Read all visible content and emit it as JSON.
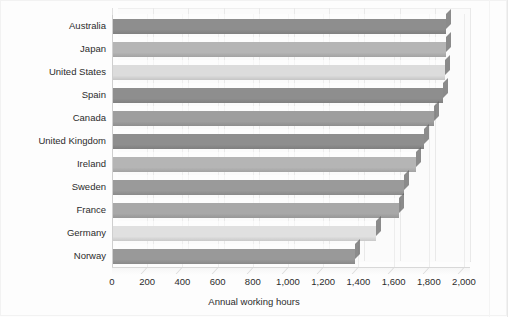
{
  "chart_data": {
    "type": "bar",
    "orientation": "horizontal",
    "title": "",
    "xlabel": "Annual working hours",
    "ylabel": "",
    "xlim": [
      0,
      2000
    ],
    "xticks": [
      0,
      200,
      400,
      600,
      800,
      1000,
      1200,
      1400,
      1600,
      1800,
      2000
    ],
    "xtick_labels": [
      "0",
      "200",
      "400",
      "600",
      "800",
      "1,000",
      "1,200",
      "1,400",
      "1,600",
      "1,800",
      "2,000"
    ],
    "grid": true,
    "legend": "none",
    "style": "3d-bar",
    "categories": [
      "Australia",
      "Japan",
      "United States",
      "Spain",
      "Canada",
      "United Kingdom",
      "Ireland",
      "Sweden",
      "France",
      "Germany",
      "Norway"
    ],
    "values": [
      1900,
      1900,
      1890,
      1880,
      1830,
      1770,
      1730,
      1660,
      1630,
      1500,
      1380
    ],
    "bar_colors": [
      "#8e8e8e",
      "#b5b5b5",
      "#dcdcdc",
      "#8e8e8e",
      "#9e9e9e",
      "#8e8e8e",
      "#b5b5b5",
      "#9a9a9a",
      "#a8a8a8",
      "#e0e0e0",
      "#999999"
    ],
    "bars": [
      {
        "category": "Australia",
        "value": 1900,
        "color": "#8e8e8e"
      },
      {
        "category": "Japan",
        "value": 1900,
        "color": "#b5b5b5"
      },
      {
        "category": "United States",
        "value": 1890,
        "color": "#dcdcdc"
      },
      {
        "category": "Spain",
        "value": 1880,
        "color": "#8e8e8e"
      },
      {
        "category": "Canada",
        "value": 1830,
        "color": "#9e9e9e"
      },
      {
        "category": "United Kingdom",
        "value": 1770,
        "color": "#8e8e8e"
      },
      {
        "category": "Ireland",
        "value": 1730,
        "color": "#b5b5b5"
      },
      {
        "category": "Sweden",
        "value": 1660,
        "color": "#9a9a9a"
      },
      {
        "category": "France",
        "value": 1630,
        "color": "#a8a8a8"
      },
      {
        "category": "Germany",
        "value": 1500,
        "color": "#e0e0e0"
      },
      {
        "category": "Norway",
        "value": 1380,
        "color": "#999999"
      }
    ]
  }
}
